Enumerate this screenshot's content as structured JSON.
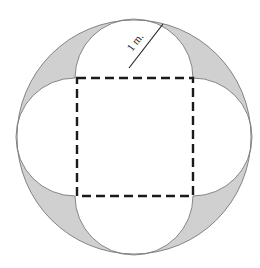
{
  "diagram": {
    "title": "",
    "label": "1 m.",
    "colors": {
      "shade": "#d0d0d0",
      "stroke": "#555555",
      "dash": "#1a1a1a",
      "background": "#ffffff"
    },
    "elements": {
      "outer_circle": "circle circumscribing the square",
      "square": "dashed square",
      "semicircles": [
        "top",
        "right",
        "bottom",
        "left"
      ],
      "shaded_regions": 4,
      "radius_marker": "segment from top semicircle center to circle, labeled 1 m."
    }
  }
}
